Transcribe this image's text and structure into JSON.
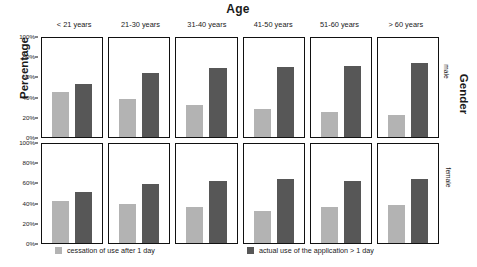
{
  "chart_data": {
    "type": "bar",
    "title": "Age",
    "xlabel": "Age",
    "ylabel": "Percentage",
    "right_label": "Gender",
    "ylim": [
      0,
      100
    ],
    "ytick_labels": [
      "0%",
      "20%",
      "40%",
      "60%",
      "80%",
      "100%"
    ],
    "ytick_values": [
      0,
      20,
      40,
      60,
      80,
      100
    ],
    "grid": false,
    "legend_position": "bottom",
    "categories": [
      "< 21 years",
      "21-30 years",
      "31-40 years",
      "41-50 years",
      "51-60 years",
      "> 60 years"
    ],
    "facet_rows": [
      "male",
      "female"
    ],
    "series": [
      {
        "name": "cessation of use after 1 day",
        "color": "#b3b3b3",
        "values_male": [
          45,
          38,
          32,
          28,
          25,
          22
        ],
        "values_female": [
          42,
          39,
          36,
          32,
          36,
          38
        ]
      },
      {
        "name": "actual use of the application > 1 day",
        "color": "#575757",
        "values_male": [
          54,
          65,
          70,
          71,
          72,
          75
        ],
        "values_female": [
          52,
          60,
          63,
          65,
          63,
          65
        ]
      }
    ]
  },
  "titles": {
    "top": "Age",
    "left": "Percentage",
    "right": "Gender"
  },
  "columns": [
    {
      "label": "< 21 years"
    },
    {
      "label": "21-30 years"
    },
    {
      "label": "31-40 years"
    },
    {
      "label": "41-50 years"
    },
    {
      "label": "51-60 years"
    },
    {
      "label": "> 60 years"
    }
  ],
  "rows": [
    {
      "label": "male"
    },
    {
      "label": "female"
    }
  ],
  "yaxis": {
    "ticks": [
      "100%",
      "80%",
      "60%",
      "40%",
      "20%",
      "0%"
    ]
  },
  "legend": {
    "items": [
      {
        "label": "cessation of use after 1 day",
        "color": "#b3b3b3"
      },
      {
        "label": "actual use of the application > 1 day",
        "color": "#575757"
      }
    ]
  }
}
